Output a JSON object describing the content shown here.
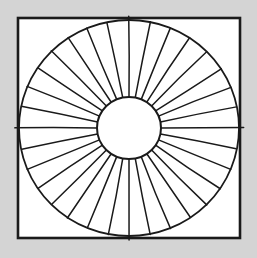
{
  "image": {
    "title": "Radial sunburst sector diagram",
    "width": 257,
    "height": 258,
    "style": "hand-drawn black line art on white, gray page background"
  },
  "colors": {
    "page_background": "#d4d4d4",
    "panel_fill": "#ffffff",
    "ink": "#1a1a1a"
  },
  "frame": {
    "name": "outer square border",
    "x": 18,
    "y": 18,
    "width": 222,
    "height": 220,
    "stroke_width": 2.6
  },
  "figure": {
    "center_x": 129,
    "center_y": 128,
    "outer_radius_x": 110,
    "outer_radius_y": 108,
    "hub_radius_x": 32,
    "hub_radius_y": 31,
    "sector_count": 32,
    "sector_angle_degrees": 11.25,
    "start_angle_degrees": 0
  },
  "hub": {
    "name": "central blank circle",
    "fill": "#ffffff",
    "radius_x": 32,
    "radius_y": 31
  }
}
